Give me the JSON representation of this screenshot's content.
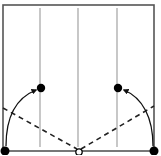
{
  "diagram": {
    "type": "origami-fold-instruction",
    "width": 161,
    "height": 155,
    "colors": {
      "border": "#555555",
      "crease": "#9a9a9a",
      "dashed": "#222222",
      "arrow": "#111111",
      "dot": "#000000",
      "background": "#ffffff"
    },
    "square": {
      "x1": 3,
      "y1": 5,
      "x2": 154,
      "y2": 151
    },
    "creases": [
      {
        "name": "crease-left",
        "x": 40,
        "y1": 8,
        "y2": 147
      },
      {
        "name": "crease-center",
        "x": 78,
        "y1": 8,
        "y2": 147
      },
      {
        "name": "crease-right",
        "x": 117,
        "y1": 8,
        "y2": 147
      }
    ],
    "valley_folds": [
      {
        "name": "valley-fold-left",
        "x1": 3,
        "y1": 108,
        "x2": 77,
        "y2": 149
      },
      {
        "name": "valley-fold-right",
        "x1": 81,
        "y1": 149,
        "x2": 154,
        "y2": 106
      }
    ],
    "points": [
      {
        "name": "target-dot-left",
        "cx": 41,
        "cy": 88,
        "r": 4.2,
        "filled": true
      },
      {
        "name": "target-dot-right",
        "cx": 118,
        "cy": 88,
        "r": 4.2,
        "filled": true
      },
      {
        "name": "corner-dot-bottom-left",
        "cx": 5,
        "cy": 151,
        "r": 4.5,
        "filled": true
      },
      {
        "name": "corner-dot-bottom-right",
        "cx": 154,
        "cy": 151,
        "r": 4.5,
        "filled": true
      },
      {
        "name": "pivot-circle-center",
        "cx": 79,
        "cy": 152,
        "r": 3.2,
        "filled": false
      }
    ],
    "arrows": [
      {
        "name": "fold-arrow-left",
        "path": "M 6 146 C 6 118, 16 98, 36 90"
      },
      {
        "name": "fold-arrow-right",
        "path": "M 153 146 C 153 118, 143 98, 124 90"
      }
    ]
  }
}
